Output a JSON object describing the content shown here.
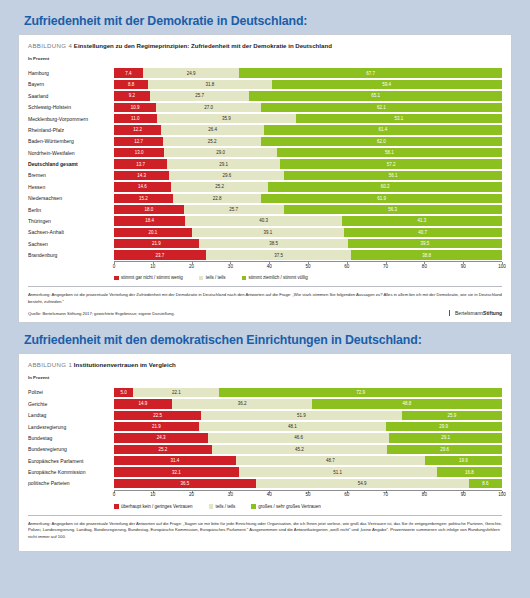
{
  "colors": {
    "negative": "#cf2027",
    "neutral": "#e3e6c4",
    "positive": "#8cc01f",
    "heading": "#1b5ea8",
    "page_bg": "#c2d0e2"
  },
  "sections": [
    {
      "heading": "Zufriedenheit mit der Demokratie in Deutschland:",
      "figure_number": "ABBILDUNG 4",
      "figure_title": "Einstellungen zu den Regimeprinzipien: Zufriedenheit mit der Demokratie in Deutschland",
      "unit_label": "In Prozent",
      "legend": [
        "stimmt gar nicht / stimmt wenig",
        "teils / teils",
        "stimmt ziemlich / stimmt völlig"
      ],
      "note": "Anmerkung: Angegeben ist die prozentuale Verteilung der Zufriedenheit mit der Demokratie in Deutschland nach den Antworten auf die Frage: „Wie stark stimmen Sie folgenden Aussagen zu? Alles in allem bin ich mit der Demokratie, wie sie in Deutschland besteht, zufrieden.“",
      "source": "Quelle: Bertelsmann Stiftung 2017; gewichtete Ergebnisse; eigene Darstellung.",
      "brand_light": "Bertelsmann",
      "brand_bold": "Stiftung",
      "chart_data": {
        "type": "bar",
        "orientation": "horizontal",
        "stacked": true,
        "title": "Einstellungen zu den Regimeprinzipien: Zufriedenheit mit der Demokratie in Deutschland",
        "xlabel": "In Prozent",
        "ylabel": "",
        "xlim": [
          0,
          100
        ],
        "xticks": [
          0,
          10,
          20,
          30,
          40,
          50,
          60,
          70,
          80,
          90,
          100
        ],
        "grid": false,
        "legend_position": "bottom",
        "categories": [
          "Hamburg",
          "Bayern",
          "Saarland",
          "Schleswig-Holstein",
          "Mecklenburg-Vorpommern",
          "Rheinland-Pfalz",
          "Baden-Württemberg",
          "Nordrhein-Westfalen",
          "Deutschland gesamt",
          "Bremen",
          "Hessen",
          "Niedersachsen",
          "Berlin",
          "Thüringen",
          "Sachsen-Anhalt",
          "Sachsen",
          "Brandenburg"
        ],
        "series": [
          {
            "name": "stimmt gar nicht / stimmt wenig",
            "values": [
              7.4,
              8.8,
              9.2,
              10.9,
              11.0,
              12.2,
              12.7,
              13.0,
              13.7,
              14.3,
              14.6,
              15.2,
              18.0,
              18.4,
              20.1,
              21.9,
              23.7
            ]
          },
          {
            "name": "teils / teils",
            "values": [
              24.9,
              31.8,
              25.7,
              27.0,
              35.9,
              26.4,
              25.2,
              29.0,
              29.1,
              29.6,
              25.2,
              22.8,
              25.7,
              40.3,
              39.1,
              38.5,
              37.5
            ]
          },
          {
            "name": "stimmt ziemlich / stimmt völlig",
            "values": [
              67.7,
              59.4,
              65.1,
              62.1,
              53.1,
              61.4,
              62.0,
              58.1,
              57.2,
              56.1,
              60.2,
              61.9,
              56.3,
              41.3,
              40.7,
              39.5,
              38.8
            ]
          }
        ]
      }
    },
    {
      "heading": "Zufriedenheit mit den demokratischen Einrichtungen in Deutschland:",
      "figure_number": "ABBILDUNG 1",
      "figure_title": "Institutionenvertrauen im Vergleich",
      "unit_label": "In Prozent",
      "legend": [
        "überhaupt kein / geringes Vertrauen",
        "teils / teils",
        "großes / sehr großes Vertrauen"
      ],
      "note": "Anmerkung: Angegeben ist die prozentuale Verteilung der Antworten auf die Frage: „Sagen sie mir bitte für jede Einrichtung oder Organisation, die ich Ihnen jetzt vorlese, wie groß das Vertrauen ist, das Sie ihr entgegenbringen: politische Parteien, Gerichte, Polizei, Landesregierung, Landtag, Bundesregierung, Bundestag, Europäische Kommission, Europäisches Parlament.“ Ausgenommen sind die Antwortkategorien „weiß nicht“ und „keine Angabe“. Prozentwerte summieren sich infolge von Rundungsfehlern nicht immer auf 100.",
      "source": "",
      "brand_light": "",
      "brand_bold": "",
      "chart_data": {
        "type": "bar",
        "orientation": "horizontal",
        "stacked": true,
        "title": "Institutionenvertrauen im Vergleich",
        "xlabel": "In Prozent",
        "ylabel": "",
        "xlim": [
          0,
          100
        ],
        "xticks": [
          0,
          10,
          20,
          30,
          40,
          50,
          60,
          70,
          80,
          90,
          100
        ],
        "grid": false,
        "legend_position": "bottom",
        "categories": [
          "Polizei",
          "Gerichte",
          "Landtag",
          "Landesregierung",
          "Bundestag",
          "Bundesregierung",
          "Europäisches Parlament",
          "Europäische Kommission",
          "politische Parteien"
        ],
        "series": [
          {
            "name": "überhaupt kein / geringes Vertrauen",
            "values": [
              5.0,
              14.9,
              22.5,
              21.9,
              24.3,
              25.2,
              31.4,
              32.1,
              36.5
            ]
          },
          {
            "name": "teils / teils",
            "values": [
              22.1,
              36.2,
              51.9,
              48.1,
              46.6,
              45.2,
              48.7,
              51.1,
              54.9
            ]
          },
          {
            "name": "großes / sehr großes Vertrauen",
            "values": [
              72.9,
              48.8,
              25.9,
              29.9,
              29.1,
              29.6,
              19.9,
              16.8,
              8.6
            ]
          }
        ]
      }
    }
  ]
}
